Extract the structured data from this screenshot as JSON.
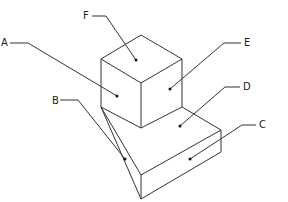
{
  "diagram": {
    "stroke_color": "#333333",
    "labels": [
      {
        "id": "A",
        "text": "A",
        "x": 1,
        "y": 38
      },
      {
        "id": "B",
        "text": "B",
        "x": 52,
        "y": 97
      },
      {
        "id": "C",
        "text": "C",
        "x": 260,
        "y": 121
      },
      {
        "id": "D",
        "text": "D",
        "x": 243,
        "y": 82
      },
      {
        "id": "E",
        "text": "E",
        "x": 244,
        "y": 38
      },
      {
        "id": "F",
        "text": "F",
        "x": 83,
        "y": 12
      }
    ]
  }
}
